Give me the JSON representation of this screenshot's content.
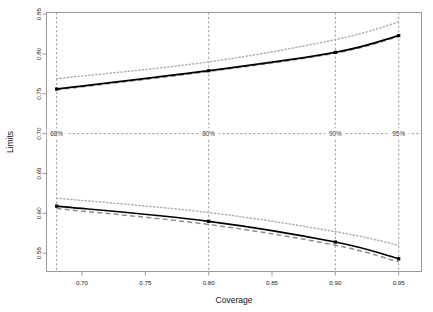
{
  "figure": {
    "width": 433,
    "height": 312,
    "background": "#ffffff"
  },
  "chart_data": {
    "type": "line",
    "title": "",
    "xlabel": "Coverage",
    "ylabel": "Limits",
    "xlim": [
      0.672,
      0.968
    ],
    "ylim": [
      0.527,
      0.852
    ],
    "grid": false,
    "legend": "none",
    "xticks": [
      0.7,
      0.75,
      0.8,
      0.85,
      0.9,
      0.95
    ],
    "xticklabels": [
      "0.70",
      "0.75",
      "0.80",
      "0.85",
      "0.90",
      "0.95"
    ],
    "yticks": [
      0.55,
      0.6,
      0.65,
      0.7,
      0.75,
      0.8,
      0.85
    ],
    "yticklabels": [
      "0.55",
      "0.60",
      "0.65",
      "0.70",
      "0.75",
      "0.80",
      "0.85"
    ],
    "x": [
      0.68,
      0.8,
      0.9,
      0.95
    ],
    "series": [
      {
        "name": "upper-limit-outer",
        "style": "dotted",
        "color": "#b0b0b0",
        "band": "upper",
        "values": [
          0.769,
          0.79,
          0.818,
          0.84
        ]
      },
      {
        "name": "upper-limit-estimate",
        "style": "solid",
        "color": "#000000",
        "band": "upper",
        "values": [
          0.756,
          0.779,
          0.802,
          0.823
        ]
      },
      {
        "name": "upper-limit-inner",
        "style": "dashed",
        "color": "#8f8f8f",
        "band": "upper",
        "values": [
          0.755,
          0.778,
          0.801,
          0.822
        ]
      },
      {
        "name": "lower-limit-outer",
        "style": "dotted",
        "color": "#b0b0b0",
        "band": "lower",
        "values": [
          0.619,
          0.601,
          0.577,
          0.56
        ]
      },
      {
        "name": "lower-limit-estimate",
        "style": "solid",
        "color": "#000000",
        "band": "lower",
        "values": [
          0.609,
          0.59,
          0.564,
          0.543
        ]
      },
      {
        "name": "lower-limit-inner",
        "style": "dashed",
        "color": "#8f8f8f",
        "band": "lower",
        "values": [
          0.606,
          0.586,
          0.56,
          0.539
        ]
      }
    ],
    "reference_lines": {
      "horizontal": [
        {
          "name": "median-reference",
          "y": 0.7,
          "style": "dashed",
          "color": "#8d8d8d"
        }
      ],
      "vertical": [
        {
          "name": "coverage-68",
          "x": 0.68,
          "label": "68%",
          "style": "dashed",
          "color": "#8d8d8d"
        },
        {
          "name": "coverage-80",
          "x": 0.8,
          "label": "80%",
          "style": "dashed",
          "color": "#8d8d8d"
        },
        {
          "name": "coverage-90",
          "x": 0.9,
          "label": "90%",
          "style": "dashed",
          "color": "#8d8d8d"
        },
        {
          "name": "coverage-95",
          "x": 0.95,
          "label": "95%",
          "style": "dashed",
          "color": "#8d8d8d"
        }
      ]
    },
    "annotations": [
      {
        "text": "68%",
        "x": 0.68,
        "y": 0.7
      },
      {
        "text": "80%",
        "x": 0.8,
        "y": 0.7
      },
      {
        "text": "90%",
        "x": 0.9,
        "y": 0.7
      },
      {
        "text": "95%",
        "x": 0.95,
        "y": 0.7
      }
    ]
  }
}
